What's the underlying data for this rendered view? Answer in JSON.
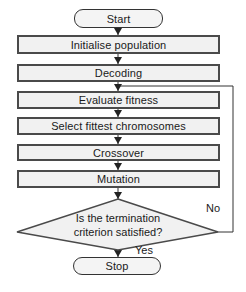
{
  "diagram": {
    "type": "flowchart",
    "nodes": {
      "start": "Start",
      "init": "Initialise population",
      "decoding": "Decoding",
      "evaluate": "Evaluate fitness",
      "select": "Select fittest chromosomes",
      "crossover": "Crossover",
      "mutation": "Mutation",
      "decision_line1": "Is the termination",
      "decision_line2": "criterion satisfied?",
      "stop": "Stop"
    },
    "edge_labels": {
      "no": "No",
      "yes": "Yes"
    },
    "edges": [
      [
        "Start",
        "Initialise population"
      ],
      [
        "Initialise population",
        "Decoding"
      ],
      [
        "Decoding",
        "Evaluate fitness"
      ],
      [
        "Evaluate fitness",
        "Select fittest chromosomes"
      ],
      [
        "Select fittest chromosomes",
        "Crossover"
      ],
      [
        "Crossover",
        "Mutation"
      ],
      [
        "Mutation",
        "Is the termination criterion satisfied?"
      ],
      [
        "Is the termination criterion satisfied?",
        "Stop",
        "Yes"
      ],
      [
        "Is the termination criterion satisfied?",
        "Evaluate fitness",
        "No"
      ]
    ],
    "colors": {
      "box_fill": "#f1f1f1",
      "border": "#4a4a4a",
      "line": "#333333",
      "text": "#1a1a1a"
    }
  }
}
